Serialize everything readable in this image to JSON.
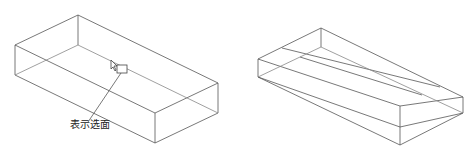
{
  "figure_left": {
    "callout_label": "表示选面",
    "label_pos": {
      "x": 72,
      "y": 122
    }
  },
  "figure_right": {},
  "colors": {
    "line": "#555555",
    "text": "#222222"
  }
}
